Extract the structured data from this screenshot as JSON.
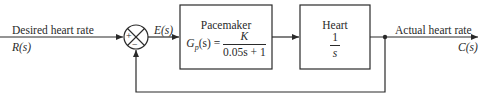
{
  "diagram": {
    "type": "feedback-control-block-diagram",
    "input": {
      "label": "Desired heart rate",
      "signal": "R(s)"
    },
    "summing_junction": {
      "plus_sign": "+",
      "minus_sign": "−"
    },
    "error_signal": "E(s)",
    "blocks": [
      {
        "title": "Pacemaker",
        "transfer_lhs": "G",
        "transfer_sub": "p",
        "transfer_arg": "(s) =",
        "numerator": "K",
        "denominator": "0.05s + 1"
      },
      {
        "title": "Heart",
        "numerator": "1",
        "denominator": "s"
      }
    ],
    "output": {
      "label": "Actual heart rate",
      "signal": "C(s)"
    },
    "feedback": "unity negative feedback"
  },
  "colors": {
    "line": "#2a2a2a",
    "background": "#ffffff"
  }
}
